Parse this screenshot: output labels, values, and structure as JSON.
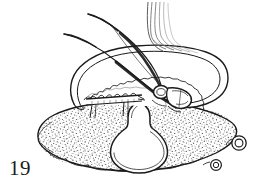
{
  "plate": {
    "width": 272,
    "height": 190,
    "background_color": "#ffffff",
    "figure_number": "19",
    "ink_color": "#1a1a1a",
    "stipple_color": "#2b2b2b",
    "hairline_color": "#555555"
  },
  "figure": {
    "caption_label": "19",
    "parts": [
      {
        "id": "stippled-body",
        "label": "stippled body mass"
      },
      {
        "id": "central-aperture",
        "label": "central pear-shaped aperture"
      },
      {
        "id": "arched-lobe",
        "label": "arched scalloped lobe"
      },
      {
        "id": "median-tube",
        "label": "median striated tube"
      },
      {
        "id": "appendage-left",
        "label": "left tapering appendage"
      },
      {
        "id": "appendage-right",
        "label": "right tapering appendage"
      },
      {
        "id": "transverse-bar",
        "label": "transverse nodulate bar"
      },
      {
        "id": "central-ring",
        "label": "central ring"
      },
      {
        "id": "wedge-process",
        "label": "wedge process"
      },
      {
        "id": "ring-organ-upper",
        "label": "upper ring organ"
      },
      {
        "id": "ring-organ-lower",
        "label": "lower ring organ"
      }
    ]
  }
}
